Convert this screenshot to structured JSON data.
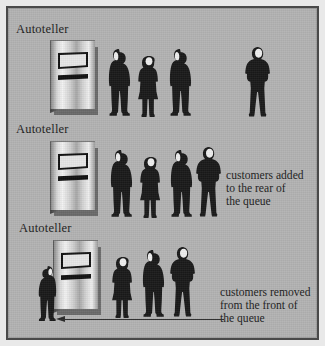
{
  "figure": {
    "background_color": "#b3b3b3",
    "frame_color": "#4a4a4a",
    "ink_color": "#1c1c1c"
  },
  "rows": [
    {
      "id": "row-initial-queue",
      "atm_label": "Autoteller",
      "caption_lines": [],
      "queue_people": [
        {
          "type": "man-profile-left",
          "label": "customer"
        },
        {
          "type": "woman",
          "label": "customer"
        },
        {
          "type": "man-profile-left",
          "label": "customer"
        }
      ],
      "detached_people": [
        {
          "type": "man-front",
          "label": "arriving customer"
        }
      ],
      "has_arrow": false
    },
    {
      "id": "row-customer-added",
      "atm_label": "Autoteller",
      "caption_lines": [
        "customers added",
        "to the rear of",
        "the queue"
      ],
      "queue_people": [
        {
          "type": "man-profile-left",
          "label": "customer"
        },
        {
          "type": "woman",
          "label": "customer"
        },
        {
          "type": "man-profile-left",
          "label": "customer"
        },
        {
          "type": "man-front",
          "label": "customer"
        }
      ],
      "detached_people": [],
      "has_arrow": false
    },
    {
      "id": "row-customer-removed",
      "atm_label": "Autoteller",
      "caption_lines": [
        "customers removed",
        "from the front of",
        "the queue"
      ],
      "served_person": {
        "type": "man-profile-right",
        "label": "customer being served"
      },
      "queue_people": [
        {
          "type": "woman",
          "label": "customer"
        },
        {
          "type": "man-profile-left",
          "label": "customer"
        },
        {
          "type": "man-front",
          "label": "customer"
        }
      ],
      "detached_people": [],
      "has_arrow": true,
      "arrow_direction": "left"
    }
  ]
}
